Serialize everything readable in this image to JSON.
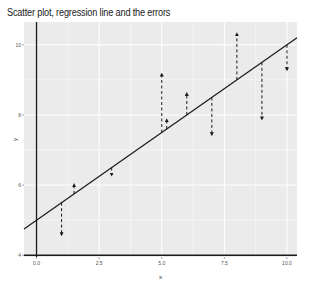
{
  "chart_data": {
    "type": "scatter",
    "title": "Scatter plot, regression line and the errors",
    "xlabel": "x",
    "ylabel": "y",
    "xlim": [
      -0.5,
      10.4
    ],
    "ylim": [
      3.95,
      10.65
    ],
    "x_ticks": [
      0.0,
      2.5,
      5.0,
      7.5,
      10.0
    ],
    "x_tick_labels": [
      "0.0",
      "2.5",
      "5.0",
      "7.5",
      "10.0"
    ],
    "y_ticks": [
      4,
      6,
      8,
      10
    ],
    "y_tick_labels": [
      "4",
      "6",
      "8",
      "10"
    ],
    "grid": true,
    "reference_lines": {
      "vline_x": 0,
      "hline_y": 4
    },
    "regression_line": {
      "intercept": 5.0,
      "slope": 0.5
    },
    "points": [
      {
        "x": 1.0,
        "y": 4.6,
        "fitted": 5.5
      },
      {
        "x": 1.5,
        "y": 6.0,
        "fitted": 5.75
      },
      {
        "x": 3.0,
        "y": 6.3,
        "fitted": 6.5
      },
      {
        "x": 5.0,
        "y": 9.15,
        "fitted": 7.5
      },
      {
        "x": 5.2,
        "y": 7.85,
        "fitted": 7.6
      },
      {
        "x": 6.0,
        "y": 8.6,
        "fitted": 8.0
      },
      {
        "x": 7.0,
        "y": 7.45,
        "fitted": 8.5
      },
      {
        "x": 8.0,
        "y": 10.3,
        "fitted": 9.0
      },
      {
        "x": 9.0,
        "y": 7.9,
        "fitted": 9.5
      },
      {
        "x": 10.0,
        "y": 9.3,
        "fitted": 10.0
      }
    ],
    "colors": {
      "panel_bg": "#ebebeb",
      "grid": "#ffffff",
      "line": "#1a1a1a",
      "error": "#1a1a1a"
    }
  }
}
